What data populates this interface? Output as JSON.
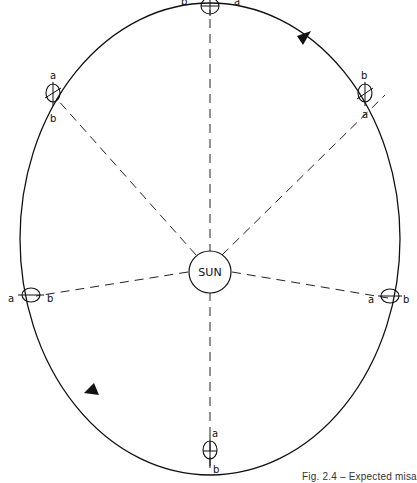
{
  "diagram": {
    "center_label": "SUN",
    "caption": "Fig. 2.4 – Expected misa",
    "line_color": "#111111",
    "positions": [
      {
        "id": "top",
        "label_a": "a",
        "label_b": "b"
      },
      {
        "id": "upper-right",
        "label_a": "a",
        "label_b": "b"
      },
      {
        "id": "right",
        "label_a": "a",
        "label_b": "b"
      },
      {
        "id": "bottom",
        "label_a": "a",
        "label_b": "b"
      },
      {
        "id": "left",
        "label_a": "a",
        "label_b": "b"
      },
      {
        "id": "upper-left",
        "label_a": "a",
        "label_b": "b"
      }
    ],
    "direction_arrows": [
      "upper-right-arrow",
      "lower-left-arrow"
    ]
  }
}
